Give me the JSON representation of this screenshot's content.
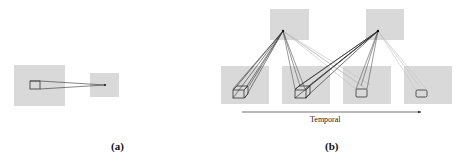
{
  "figure": {
    "panels": [
      {
        "id": "a",
        "caption": "(a)",
        "description": "Single frame: box in a large feature map projects to a point in a smaller feature map"
      },
      {
        "id": "b",
        "caption": "(b)",
        "description": "Temporal: boxes in four consecutive frames project to points in two upper feature maps",
        "axis_label": "Temporal"
      }
    ],
    "colors": {
      "map_fill": "#d9d9d9",
      "line_dark": "#333333",
      "line_light": "#b8b8b8",
      "background": "#ffffff"
    }
  }
}
